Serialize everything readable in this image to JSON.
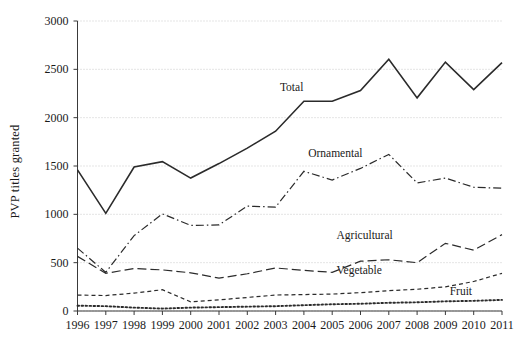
{
  "chart_data": {
    "type": "line",
    "title": "",
    "xlabel": "",
    "ylabel": "PVP titles granted",
    "x": [
      1996,
      1997,
      1998,
      1999,
      2000,
      2001,
      2002,
      2003,
      2004,
      2005,
      2006,
      2007,
      2008,
      2009,
      2010,
      2011
    ],
    "xlim": [
      1996,
      2011
    ],
    "ylim": [
      0,
      3000
    ],
    "yticks": [
      0,
      500,
      1000,
      1500,
      2000,
      2500,
      3000
    ],
    "xticks": [
      "1996",
      "1997",
      "1998",
      "1999",
      "2000",
      "2001",
      "2002",
      "2003",
      "2004",
      "2005",
      "2006",
      "2007",
      "2008",
      "2009",
      "2010",
      "2011"
    ],
    "grid": true,
    "legend": "inline-annotations",
    "series": [
      {
        "name": "Total",
        "style": "solid",
        "color": "#2b2b2b",
        "label_x": 2004,
        "label_y": 2320,
        "values": [
          1460,
          1010,
          1490,
          1545,
          1375,
          1525,
          1685,
          1860,
          2170,
          2170,
          2280,
          2605,
          2205,
          2575,
          2290,
          2570
        ]
      },
      {
        "name": "Ornamental",
        "style": "dash-dot",
        "color": "#2b2b2b",
        "label_x": 2005,
        "label_y": 1630,
        "values": [
          650,
          400,
          780,
          1005,
          885,
          890,
          1085,
          1075,
          1445,
          1355,
          1475,
          1620,
          1325,
          1375,
          1280,
          1270
        ]
      },
      {
        "name": "Agricultural",
        "style": "dash",
        "color": "#2b2b2b",
        "label_x": 2006,
        "label_y": 790,
        "values": [
          565,
          390,
          440,
          425,
          395,
          340,
          385,
          445,
          420,
          400,
          515,
          530,
          500,
          700,
          630,
          790
        ]
      },
      {
        "name": "Vegetable",
        "style": "short-dash",
        "color": "#2b2b2b",
        "label_x": 2006,
        "label_y": 420,
        "values": [
          165,
          160,
          185,
          220,
          95,
          115,
          140,
          165,
          170,
          175,
          190,
          210,
          225,
          250,
          305,
          390
        ]
      },
      {
        "name": "Fruit",
        "style": "dotted",
        "color": "#2b2b2b",
        "label_x": 2010,
        "label_y": 210,
        "values": [
          55,
          50,
          35,
          25,
          35,
          40,
          45,
          50,
          60,
          70,
          75,
          85,
          90,
          100,
          105,
          115
        ]
      }
    ]
  }
}
